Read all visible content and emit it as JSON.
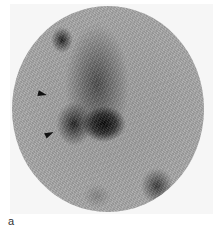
{
  "figure": {
    "panel_label": "a",
    "image_description": "Grayscale circular scintigraphy scan showing focal dark uptake regions",
    "annotations": [
      {
        "type": "arrowhead",
        "position": "upper-left of central uptake",
        "direction": "right"
      },
      {
        "type": "arrowhead",
        "position": "lower-left of central uptake",
        "direction": "up-right"
      }
    ]
  }
}
